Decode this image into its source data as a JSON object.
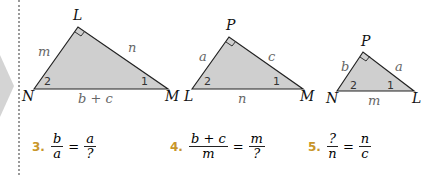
{
  "triangles": [
    {
      "vertices": {
        "top": "L",
        "left": "N",
        "right": "M"
      },
      "sides": {
        "left": "m",
        "right": "n",
        "base": "b + c"
      },
      "angles": {
        "left": "2",
        "right": "1"
      }
    },
    {
      "vertices": {
        "top": "P",
        "left": "L",
        "right": "M"
      },
      "sides": {
        "left": "a",
        "right": "c",
        "base": "n"
      },
      "angles": {
        "left": "2",
        "right": "1"
      }
    },
    {
      "vertices": {
        "top": "P",
        "left": "N",
        "right": "L"
      },
      "sides": {
        "left": "b",
        "right": "a",
        "base": "m"
      },
      "angles": {
        "left": "2",
        "right": "1"
      }
    }
  ],
  "exercises": [
    {
      "number": "3.",
      "lhs_num": "b",
      "lhs_den": "a",
      "eq": "=",
      "rhs_num": "a",
      "rhs_den": "?"
    },
    {
      "number": "4.",
      "lhs_num": "b + c",
      "lhs_den": "m",
      "eq": "=",
      "rhs_num": "m",
      "rhs_den": "?"
    },
    {
      "number": "5.",
      "lhs_num": "?",
      "lhs_den": "n",
      "eq": "=",
      "rhs_num": "n",
      "rhs_den": "c"
    }
  ],
  "colors": {
    "triangle_fill": "#cfcfcf",
    "number_accent": "#c8962a"
  }
}
